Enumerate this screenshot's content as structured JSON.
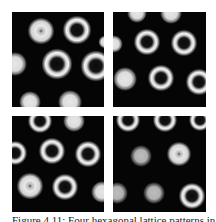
{
  "figure": {
    "caption": "Figure 4.11: Four hexagonal lattice patterns in the",
    "panels": [
      {
        "id": "top-left",
        "spots": [
          {
            "x": 29,
            "y": 19,
            "r": 12,
            "type": "filled-hole"
          },
          {
            "x": 65,
            "y": 18,
            "r": 13,
            "type": "ring"
          },
          {
            "x": 3,
            "y": 52,
            "r": 11,
            "type": "filled"
          },
          {
            "x": 45,
            "y": 52,
            "r": 14,
            "type": "ring"
          },
          {
            "x": 84,
            "y": 54,
            "r": 14,
            "type": "ring"
          },
          {
            "x": 18,
            "y": 90,
            "r": 10,
            "type": "filled"
          },
          {
            "x": 58,
            "y": 90,
            "r": 11,
            "type": "filled"
          },
          {
            "x": 93,
            "y": 30,
            "r": 6,
            "type": "filled"
          }
        ]
      },
      {
        "id": "top-right",
        "spots": [
          {
            "x": 24,
            "y": 1,
            "r": 9,
            "type": "filled"
          },
          {
            "x": 58,
            "y": 1,
            "r": 10,
            "type": "filled"
          },
          {
            "x": 1,
            "y": 32,
            "r": 8,
            "type": "filled"
          },
          {
            "x": 34,
            "y": 30,
            "r": 12,
            "type": "ring"
          },
          {
            "x": 71,
            "y": 31,
            "r": 12,
            "type": "ring"
          },
          {
            "x": 12,
            "y": 67,
            "r": 11,
            "type": "filled"
          },
          {
            "x": 48,
            "y": 66,
            "r": 12,
            "type": "ring"
          },
          {
            "x": 86,
            "y": 70,
            "r": 12,
            "type": "ring"
          }
        ]
      },
      {
        "id": "bottom-left",
        "spots": [
          {
            "x": 28,
            "y": 5,
            "r": 11,
            "type": "ring"
          },
          {
            "x": 62,
            "y": 5,
            "r": 10,
            "type": "filled"
          },
          {
            "x": 3,
            "y": 37,
            "r": 11,
            "type": "ring"
          },
          {
            "x": 40,
            "y": 35,
            "r": 12,
            "type": "ring"
          },
          {
            "x": 76,
            "y": 38,
            "r": 12,
            "type": "ring"
          },
          {
            "x": 18,
            "y": 70,
            "r": 12,
            "type": "filled-hole"
          },
          {
            "x": 53,
            "y": 71,
            "r": 12,
            "type": "ring"
          },
          {
            "x": 90,
            "y": 76,
            "r": 10,
            "type": "filled"
          }
        ]
      },
      {
        "id": "bottom-right",
        "spots": [
          {
            "x": 15,
            "y": 4,
            "r": 11,
            "type": "ring"
          },
          {
            "x": 52,
            "y": 4,
            "r": 11,
            "type": "ring"
          },
          {
            "x": 87,
            "y": 4,
            "r": 10,
            "type": "ring"
          },
          {
            "x": 28,
            "y": 40,
            "r": 10,
            "type": "filled-grey"
          },
          {
            "x": 66,
            "y": 38,
            "r": 11,
            "type": "filled-hole"
          },
          {
            "x": 4,
            "y": 77,
            "r": 10,
            "type": "filled-grey"
          },
          {
            "x": 41,
            "y": 77,
            "r": 10,
            "type": "filled-grey"
          },
          {
            "x": 79,
            "y": 80,
            "r": 12,
            "type": "ring"
          }
        ]
      }
    ]
  }
}
